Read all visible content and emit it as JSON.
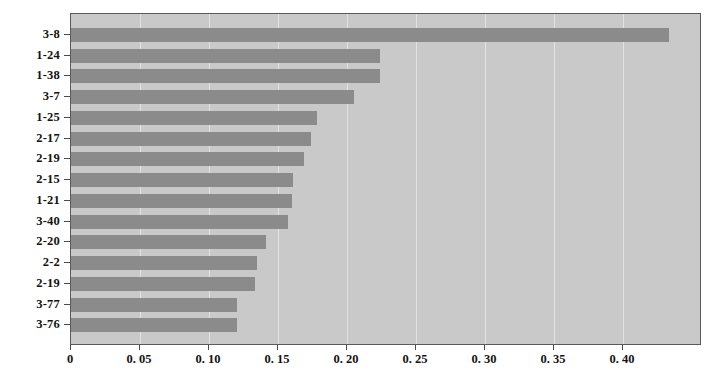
{
  "chart_data": {
    "type": "bar",
    "orientation": "horizontal",
    "title": "",
    "subtitle": "",
    "xlabel": "",
    "ylabel": "",
    "categories": [
      "3-8",
      "1-24",
      "1-38",
      "3-7",
      "1-25",
      "2-17",
      "2-19",
      "2-15",
      "1-21",
      "3-40",
      "2-20",
      "2-2",
      "2-19",
      "3-77",
      "3-76"
    ],
    "values": [
      0.433,
      0.224,
      0.224,
      0.205,
      0.178,
      0.174,
      0.169,
      0.161,
      0.16,
      0.157,
      0.141,
      0.135,
      0.133,
      0.12,
      0.12
    ],
    "xlim": [
      0,
      0.4572
    ],
    "xticks": [
      0,
      0.05,
      0.1,
      0.15,
      0.2,
      0.25,
      0.3,
      0.35,
      0.4
    ],
    "xticklabels": [
      "0",
      "0. 05",
      "0. 10",
      "0. 15",
      "0. 20",
      "0. 25",
      "0. 30",
      "0. 35",
      "0. 40"
    ],
    "yticklabels": [
      "3-8",
      "1-24",
      "1-38",
      "3-7",
      "1-25",
      "2-17",
      "2-19",
      "2-15",
      "1-21",
      "3-40",
      "2-20",
      "2-2",
      "2-19",
      "3-77",
      "3-76"
    ],
    "grid": {
      "x": true,
      "y": false
    },
    "legend": null,
    "colors": {
      "bar": "#8b8b8b",
      "plot_background": "#c9c9c9",
      "gridline": "#e2e2e2",
      "axis": "#4a4a4a",
      "text": "#131313",
      "figure_background": "#ffffff"
    }
  }
}
